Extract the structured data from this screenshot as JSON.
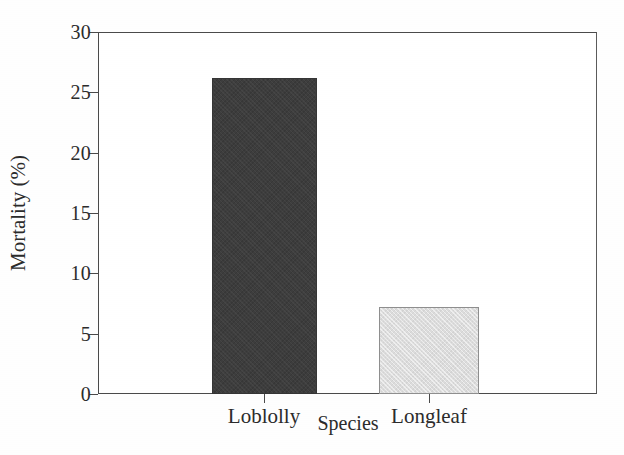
{
  "chart_data": {
    "type": "bar",
    "title": "",
    "xlabel": "Species",
    "ylabel": "Mortality (%)",
    "categories": [
      "Loblolly",
      "Longleaf"
    ],
    "values": [
      26.2,
      7.2
    ],
    "series": [
      {
        "name": "Mortality",
        "values": [
          26.2,
          7.2
        ]
      }
    ],
    "bar_colors": [
      "#3d3d3d",
      "#dcdcdc"
    ],
    "ylim": [
      0,
      30
    ],
    "yticks": [
      0,
      5,
      10,
      15,
      20,
      25,
      30
    ],
    "ytick_labels": [
      "0",
      "5",
      "10",
      "15",
      "20",
      "25",
      "30"
    ],
    "grid": false,
    "legend": "none",
    "axis_color": "#4a4a4a",
    "background": "#ffffff"
  }
}
